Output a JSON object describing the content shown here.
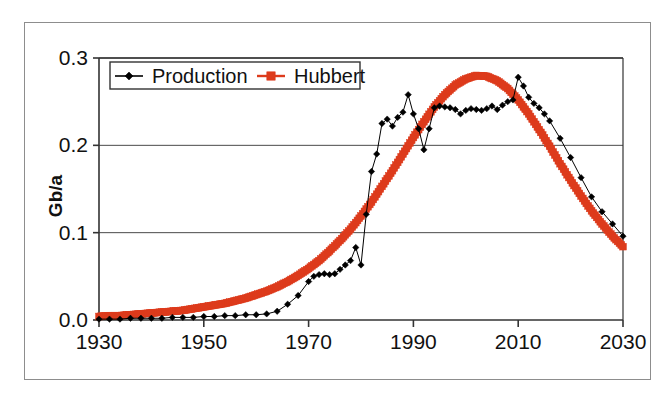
{
  "figure": {
    "background_color": "#ffffff",
    "frame_color": "#8d8d8d"
  },
  "chart_data": {
    "type": "line",
    "title": "",
    "subtitle": "",
    "xlabel": "",
    "ylabel": "Gb/a",
    "xlim": [
      1930,
      2030
    ],
    "ylim": [
      0.0,
      0.3
    ],
    "xticks": [
      1930,
      1950,
      1970,
      1990,
      2010,
      2030
    ],
    "xtick_labels": [
      "1930",
      "1950",
      "1970",
      "1990",
      "2010",
      "2030"
    ],
    "yticks": [
      0.0,
      0.1,
      0.2,
      0.3
    ],
    "ytick_labels": [
      "0.0",
      "0.1",
      "0.2",
      "0.3"
    ],
    "grid": "horizontal",
    "legend_position": "upper-left-inside",
    "series": [
      {
        "name": "Production",
        "color": "#000000",
        "marker": "diamond",
        "line_width": 1,
        "x": [
          1930,
          1932,
          1934,
          1936,
          1938,
          1940,
          1942,
          1944,
          1946,
          1948,
          1950,
          1952,
          1954,
          1956,
          1958,
          1960,
          1962,
          1964,
          1966,
          1968,
          1970,
          1971,
          1972,
          1973,
          1974,
          1975,
          1976,
          1977,
          1978,
          1979,
          1980,
          1981,
          1982,
          1983,
          1984,
          1985,
          1986,
          1987,
          1988,
          1989,
          1990,
          1991,
          1992,
          1993,
          1994,
          1995,
          1996,
          1997,
          1998,
          1999,
          2000,
          2001,
          2002,
          2003,
          2004,
          2005,
          2006,
          2007,
          2008,
          2009,
          2010,
          2011,
          2012,
          2013,
          2014,
          2015,
          2016,
          2018,
          2020,
          2022,
          2024,
          2026,
          2028,
          2030
        ],
        "y": [
          0.001,
          0.001,
          0.001,
          0.002,
          0.002,
          0.002,
          0.002,
          0.003,
          0.003,
          0.003,
          0.004,
          0.004,
          0.005,
          0.005,
          0.006,
          0.006,
          0.007,
          0.01,
          0.018,
          0.028,
          0.044,
          0.05,
          0.052,
          0.053,
          0.052,
          0.053,
          0.058,
          0.063,
          0.068,
          0.083,
          0.063,
          0.121,
          0.17,
          0.19,
          0.225,
          0.23,
          0.222,
          0.232,
          0.238,
          0.258,
          0.236,
          0.219,
          0.195,
          0.219,
          0.243,
          0.245,
          0.244,
          0.243,
          0.241,
          0.236,
          0.24,
          0.242,
          0.241,
          0.24,
          0.242,
          0.245,
          0.241,
          0.246,
          0.25,
          0.252,
          0.278,
          0.268,
          0.255,
          0.248,
          0.243,
          0.236,
          0.228,
          0.208,
          0.186,
          0.163,
          0.141,
          0.124,
          0.11,
          0.096
        ]
      },
      {
        "name": "Hubbert",
        "color": "#dd3b1c",
        "marker": "square",
        "line_width": 7,
        "x": [
          1930,
          1932,
          1934,
          1936,
          1938,
          1940,
          1942,
          1944,
          1946,
          1948,
          1950,
          1952,
          1954,
          1956,
          1958,
          1960,
          1962,
          1964,
          1966,
          1968,
          1970,
          1972,
          1974,
          1976,
          1978,
          1980,
          1982,
          1984,
          1986,
          1988,
          1990,
          1992,
          1994,
          1996,
          1998,
          2000,
          2002,
          2004,
          2006,
          2008,
          2010,
          2012,
          2014,
          2016,
          2018,
          2020,
          2022,
          2024,
          2026,
          2028,
          2030
        ],
        "y": [
          0.004,
          0.005,
          0.005,
          0.006,
          0.007,
          0.008,
          0.009,
          0.01,
          0.011,
          0.013,
          0.015,
          0.017,
          0.019,
          0.022,
          0.025,
          0.029,
          0.033,
          0.038,
          0.044,
          0.051,
          0.059,
          0.068,
          0.079,
          0.091,
          0.104,
          0.119,
          0.135,
          0.153,
          0.171,
          0.19,
          0.209,
          0.227,
          0.244,
          0.258,
          0.269,
          0.276,
          0.28,
          0.279,
          0.274,
          0.265,
          0.252,
          0.236,
          0.218,
          0.199,
          0.179,
          0.16,
          0.142,
          0.125,
          0.11,
          0.096,
          0.084
        ]
      }
    ]
  },
  "legend": {
    "entries": [
      {
        "label": "Production",
        "color": "#000000",
        "marker": "diamond"
      },
      {
        "label": "Hubbert",
        "color": "#dd3b1c",
        "marker": "square"
      }
    ]
  }
}
